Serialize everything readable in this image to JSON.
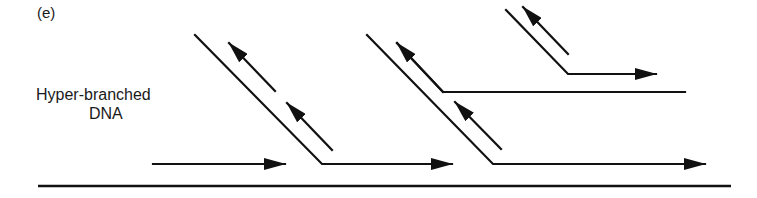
{
  "figure": {
    "panel_label": "(e)",
    "title_line1": "Hyper-branched",
    "title_line2": "DNA"
  },
  "colors": {
    "ink": "#111111",
    "background": "#ffffff"
  },
  "elements": [
    "template-strand",
    "primer-arrow",
    "displaced-strand-1",
    "displaced-strand-2",
    "branch-strand",
    "top-branch"
  ]
}
